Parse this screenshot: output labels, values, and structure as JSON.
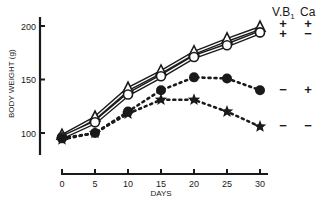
{
  "chart_data": {
    "type": "line",
    "title": "",
    "xlabel": "DAYS",
    "ylabel": "BODY WEIGHT (g)",
    "x": [
      0,
      5,
      10,
      15,
      20,
      25,
      30
    ],
    "xticks": [
      "0",
      "5",
      "10",
      "15",
      "20",
      "25",
      "30"
    ],
    "yticks": [
      "100",
      "150",
      "200"
    ],
    "xlim": [
      0,
      30
    ],
    "ylim": [
      85,
      205
    ],
    "grid": false,
    "legend_position": "right",
    "legend_header": {
      "vb1": "V.B",
      "vb1_sub": "1",
      "ca": "Ca"
    },
    "series": [
      {
        "name": "V.B1 +, Ca +",
        "marker": "open-triangle",
        "line": "solid-double",
        "vb1": "+",
        "ca": "+",
        "values": [
          97,
          114,
          141,
          157,
          175,
          187,
          198
        ]
      },
      {
        "name": "V.B1 +, Ca -",
        "marker": "open-circle",
        "line": "solid-double",
        "vb1": "+",
        "ca": "−",
        "values": [
          96,
          110,
          136,
          153,
          171,
          182,
          194
        ]
      },
      {
        "name": "V.B1 -, Ca +",
        "marker": "filled-circle",
        "line": "dotted",
        "vb1": "−",
        "ca": "+",
        "values": [
          95,
          100,
          120,
          140,
          152,
          151,
          140
        ]
      },
      {
        "name": "V.B1 -, Ca -",
        "marker": "filled-star",
        "line": "dotted",
        "vb1": "−",
        "ca": "−",
        "values": [
          94,
          100,
          118,
          131,
          131,
          120,
          106
        ]
      }
    ]
  },
  "colors": {
    "ink": "#1a1a1a",
    "background": "#ffffff"
  }
}
